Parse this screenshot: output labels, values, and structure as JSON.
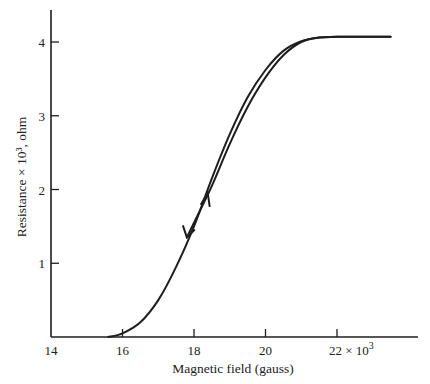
{
  "chart_data": {
    "type": "line",
    "title": "",
    "xlabel": "Magnetic field (gauss)",
    "ylabel": "Resistance × 10³, ohm",
    "x_multiplier_label": "22 × 10³",
    "xlim": [
      14,
      23.5
    ],
    "ylim": [
      0,
      4.4
    ],
    "x_ticks": [
      14,
      16,
      18,
      20,
      22
    ],
    "x_tick_labels": [
      "14",
      "16",
      "18",
      "20",
      "22 × 10³"
    ],
    "y_ticks": [
      1,
      2,
      3,
      4
    ],
    "y_tick_labels": [
      "1",
      "2",
      "3",
      "4"
    ],
    "grid": false,
    "legend": null,
    "series": [
      {
        "name": "increasing field",
        "direction": "up",
        "x": [
          15.6,
          16.0,
          16.5,
          17.0,
          17.5,
          18.0,
          18.5,
          19.0,
          19.5,
          20.0,
          20.5,
          21.0,
          21.5,
          22.0,
          23.5
        ],
        "y": [
          0.0,
          0.05,
          0.2,
          0.5,
          0.95,
          1.5,
          2.15,
          2.75,
          3.25,
          3.62,
          3.88,
          4.01,
          4.06,
          4.07,
          4.07
        ]
      },
      {
        "name": "decreasing field",
        "direction": "down",
        "x": [
          23.5,
          22.0,
          21.5,
          21.0,
          20.5,
          20.0,
          19.5,
          19.0,
          18.5,
          18.0,
          17.8
        ],
        "y": [
          4.07,
          4.07,
          4.06,
          4.0,
          3.82,
          3.52,
          3.12,
          2.62,
          2.05,
          1.55,
          1.35
        ]
      }
    ],
    "annotations": [
      {
        "type": "arrow",
        "series": "decreasing field",
        "at": [
          17.8,
          1.35
        ],
        "direction": "down-left"
      },
      {
        "type": "arrow",
        "series": "increasing field",
        "at": [
          18.3,
          1.9
        ],
        "direction": "up-right"
      }
    ]
  }
}
